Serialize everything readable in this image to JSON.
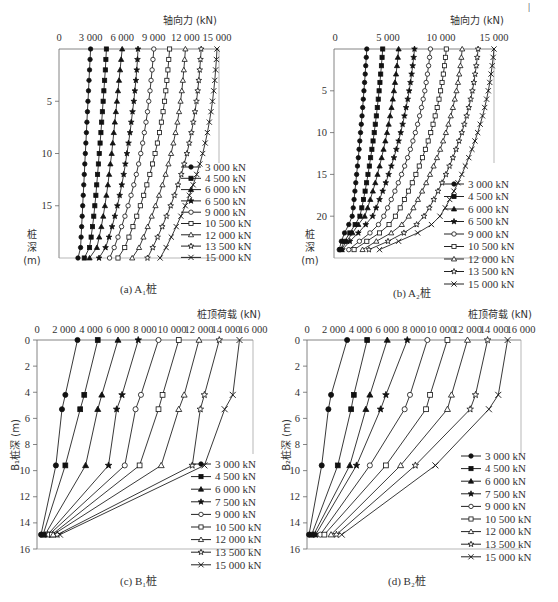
{
  "figure": {
    "corner_mark": "|"
  },
  "legend_marker_glyphs": {
    "filled-circle": "●",
    "filled-square": "■",
    "filled-triangle": "▲",
    "filled-star": "★",
    "open-circle": "○",
    "open-square": "□",
    "open-triangle": "△",
    "open-star": "☆",
    "cross": "×"
  },
  "chart_data": [
    {
      "id": "a",
      "type": "line",
      "title": "",
      "caption": "(a) A₁桩",
      "xlabel": "轴向力 (kN)",
      "ylabel": "桩\n深\n(m)",
      "ylabel_lines": [
        "桩",
        "深",
        "(m)"
      ],
      "x_ticks": [
        0,
        3000,
        6000,
        9000,
        12000,
        15000
      ],
      "x_tick_labels": [
        "0",
        "3 000",
        "6 000",
        "9 000",
        "12 000",
        "15 000"
      ],
      "y_ticks": [
        5,
        10,
        15
      ],
      "y_tick_labels": [
        "5",
        "10",
        "15"
      ],
      "xlim": [
        0,
        15000
      ],
      "ylim": [
        0,
        20
      ],
      "x_axis_position": "top",
      "y_inverted": true,
      "grid": false,
      "legend_position": "lower right (outside)",
      "box": {
        "x0": 59,
        "x1": 219,
        "y0": 49,
        "y1": 258,
        "xpx0": 59,
        "xpx1": 217
      },
      "depth": [
        0,
        1,
        2,
        3,
        4,
        5,
        6,
        7,
        8,
        9,
        10,
        11,
        12,
        13,
        14,
        15,
        16,
        17,
        18,
        19,
        20
      ],
      "series": [
        {
          "name": "3 000 kN",
          "marker": "filled-circle",
          "values": [
            3000,
            2950,
            2900,
            2850,
            2800,
            2750,
            2700,
            2650,
            2600,
            2550,
            2500,
            2450,
            2400,
            2350,
            2300,
            2250,
            2200,
            2150,
            2100,
            2050,
            1800
          ]
        },
        {
          "name": "4 500 kN",
          "marker": "filled-square",
          "values": [
            4500,
            4450,
            4400,
            4330,
            4260,
            4190,
            4120,
            4050,
            3980,
            3900,
            3820,
            3740,
            3660,
            3580,
            3500,
            3400,
            3300,
            3180,
            3050,
            2900,
            2400
          ]
        },
        {
          "name": "6 000 kN",
          "marker": "filled-triangle",
          "values": [
            6000,
            5900,
            5800,
            5700,
            5600,
            5500,
            5400,
            5300,
            5200,
            5100,
            5000,
            4880,
            4760,
            4640,
            4500,
            4360,
            4200,
            4020,
            3820,
            3600,
            2900
          ]
        },
        {
          "name": "6 500 kN",
          "marker": "filled-star",
          "values": [
            7500,
            7450,
            7380,
            7300,
            7200,
            7100,
            6980,
            6860,
            6740,
            6600,
            6450,
            6300,
            6140,
            5960,
            5760,
            5540,
            5300,
            5040,
            4750,
            4420,
            3800
          ]
        },
        {
          "name": "9 000 kN",
          "marker": "open-circle",
          "values": [
            9000,
            8920,
            8840,
            8740,
            8640,
            8520,
            8400,
            8260,
            8100,
            7940,
            7760,
            7560,
            7340,
            7100,
            6840,
            6560,
            6260,
            5940,
            5600,
            5240,
            4800
          ]
        },
        {
          "name": "10 500 kN",
          "marker": "open-square",
          "values": [
            10500,
            10420,
            10340,
            10240,
            10140,
            10020,
            9880,
            9720,
            9540,
            9340,
            9120,
            8880,
            8620,
            8340,
            8040,
            7720,
            7380,
            7020,
            6640,
            6240,
            5600
          ]
        },
        {
          "name": "12 000 kN",
          "marker": "open-triangle",
          "values": [
            12000,
            11930,
            11850,
            11760,
            11660,
            11540,
            11400,
            11240,
            11060,
            10860,
            10640,
            10390,
            10120,
            9820,
            9500,
            9160,
            8800,
            8420,
            8020,
            7600,
            6950
          ]
        },
        {
          "name": "13 500 kN",
          "marker": "open-star",
          "values": [
            13500,
            13430,
            13360,
            13270,
            13170,
            13050,
            12910,
            12750,
            12570,
            12370,
            12140,
            11890,
            11610,
            11300,
            10960,
            10600,
            10210,
            9800,
            9360,
            8900,
            8400
          ]
        },
        {
          "name": "15 000 kN",
          "marker": "cross",
          "values": [
            15000,
            14940,
            14870,
            14790,
            14690,
            14570,
            14430,
            14270,
            14090,
            13880,
            13640,
            13370,
            13070,
            12740,
            12380,
            11990,
            11570,
            11130,
            10660,
            10170,
            9600
          ]
        }
      ]
    },
    {
      "id": "b",
      "type": "line",
      "title": "",
      "caption": "(b) A₂桩",
      "xlabel": "轴向力 (kN)",
      "ylabel": "桩\n深\n(m)",
      "ylabel_lines": [
        "桩",
        "深",
        "(m)"
      ],
      "x_ticks": [
        0,
        5000,
        10000,
        15000
      ],
      "x_tick_labels": [
        "0",
        "5 000",
        "10 000",
        "15 000"
      ],
      "y_ticks": [
        5,
        10,
        15,
        20
      ],
      "y_tick_labels": [
        "5",
        "10",
        "15",
        "20"
      ],
      "xlim": [
        0,
        15000
      ],
      "ylim": [
        0,
        25
      ],
      "x_axis_position": "top",
      "y_inverted": true,
      "grid": false,
      "legend_position": "lower right (outside)",
      "box": {
        "x0": 334,
        "x1": 494,
        "y0": 49,
        "y1": 258,
        "xpx0": 335,
        "xpx1": 494
      },
      "depth": [
        0,
        1,
        2,
        3,
        4,
        5,
        6,
        7,
        8,
        9,
        10,
        11,
        12,
        13,
        14,
        15,
        16,
        17,
        18,
        19,
        20,
        21,
        22,
        23,
        24
      ],
      "series": [
        {
          "name": "3 000 kN",
          "marker": "filled-circle",
          "values": [
            3000,
            2950,
            2900,
            2850,
            2790,
            2730,
            2670,
            2610,
            2550,
            2480,
            2410,
            2340,
            2270,
            2200,
            2120,
            2040,
            1960,
            1880,
            1800,
            1720,
            1620,
            1300,
            900,
            600,
            400
          ]
        },
        {
          "name": "4 500 kN",
          "marker": "filled-square",
          "values": [
            4500,
            4440,
            4380,
            4310,
            4240,
            4160,
            4080,
            3990,
            3900,
            3800,
            3700,
            3590,
            3480,
            3360,
            3240,
            3110,
            2980,
            2840,
            2690,
            2530,
            2350,
            1900,
            1400,
            900,
            500
          ]
        },
        {
          "name": "6 000 kN",
          "marker": "filled-triangle",
          "values": [
            6000,
            5930,
            5850,
            5760,
            5660,
            5560,
            5450,
            5330,
            5200,
            5060,
            4910,
            4750,
            4580,
            4400,
            4210,
            4010,
            3800,
            3570,
            3330,
            3080,
            2800,
            2200,
            1650,
            1100,
            600
          ]
        },
        {
          "name": "6 500 kN",
          "marker": "filled-star",
          "values": [
            7500,
            7420,
            7330,
            7230,
            7120,
            7000,
            6860,
            6710,
            6550,
            6380,
            6200,
            6000,
            5790,
            5560,
            5320,
            5060,
            4790,
            4500,
            4200,
            3880,
            3550,
            2900,
            2200,
            1400,
            700
          ]
        },
        {
          "name": "9 000 kN",
          "marker": "open-circle",
          "values": [
            9000,
            8920,
            8830,
            8720,
            8600,
            8470,
            8320,
            8160,
            7980,
            7790,
            7580,
            7350,
            7110,
            6850,
            6570,
            6280,
            5970,
            5650,
            5310,
            4960,
            4600,
            4100,
            3300,
            2300,
            1300
          ]
        },
        {
          "name": "10 500 kN",
          "marker": "open-square",
          "values": [
            10500,
            10420,
            10330,
            10220,
            10100,
            9960,
            9810,
            9640,
            9450,
            9250,
            9030,
            8790,
            8530,
            8250,
            7950,
            7630,
            7290,
            6930,
            6550,
            6150,
            5700,
            5100,
            4200,
            3000,
            1800
          ]
        },
        {
          "name": "12 000 kN",
          "marker": "open-triangle",
          "values": [
            12000,
            11920,
            11830,
            11720,
            11600,
            11460,
            11300,
            11120,
            10920,
            10700,
            10460,
            10200,
            9920,
            9620,
            9300,
            8960,
            8600,
            8220,
            7820,
            7400,
            6950,
            6300,
            5300,
            3900,
            2600
          ]
        },
        {
          "name": "13 500 kN",
          "marker": "open-star",
          "values": [
            13500,
            13420,
            13330,
            13220,
            13100,
            12960,
            12800,
            12620,
            12420,
            12200,
            11960,
            11700,
            11420,
            11120,
            10800,
            10460,
            10100,
            9720,
            9320,
            8900,
            8400,
            7700,
            6500,
            5000,
            3200
          ]
        },
        {
          "name": "15 000 kN",
          "marker": "cross",
          "values": [
            15000,
            14920,
            14830,
            14720,
            14600,
            14460,
            14300,
            14120,
            13920,
            13700,
            13460,
            13200,
            12920,
            12620,
            12300,
            11960,
            11600,
            11220,
            10820,
            10400,
            9900,
            9100,
            7800,
            6000,
            4200
          ]
        }
      ]
    },
    {
      "id": "c",
      "type": "line",
      "title": "",
      "caption": "(c) B₁桩",
      "xlabel": "桩顶荷载 (kN)",
      "ylabel": "B₁桩深 (m)",
      "x_ticks": [
        0,
        2000,
        4000,
        6000,
        8000,
        10000,
        12000,
        14000,
        16000
      ],
      "x_tick_labels": [
        "0",
        "2 000",
        "4 000",
        "6 000",
        "8 000",
        "10 000",
        "12 000",
        "14 000",
        "16 000"
      ],
      "y_ticks": [
        0,
        2,
        4,
        6,
        8,
        10,
        12,
        14,
        16
      ],
      "y_tick_labels": [
        "0",
        "2",
        "4",
        "6",
        "8",
        "10",
        "12",
        "14",
        "16"
      ],
      "xlim": [
        0,
        16000
      ],
      "ylim": [
        0,
        16
      ],
      "x_axis_position": "top",
      "y_inverted": true,
      "grid": false,
      "legend_position": "lower right (outside)",
      "box": {
        "x0": 37,
        "x1": 253,
        "y0": 340,
        "y1": 549,
        "xpx0": 37,
        "xpx1": 253
      },
      "depth": [
        0,
        4.2,
        5.3,
        9.6,
        14.9
      ],
      "series": [
        {
          "name": "3 000 kN",
          "marker": "filled-circle",
          "values": [
            3000,
            2100,
            1850,
            1400,
            300
          ]
        },
        {
          "name": "4 500 kN",
          "marker": "filled-square",
          "values": [
            4500,
            3500,
            3200,
            2100,
            450
          ]
        },
        {
          "name": "6 000 kN",
          "marker": "filled-triangle",
          "values": [
            6000,
            4800,
            4500,
            3600,
            600
          ]
        },
        {
          "name": "7 500 kN",
          "marker": "filled-star",
          "values": [
            7500,
            6300,
            5900,
            5300,
            800
          ]
        },
        {
          "name": "9 000 kN",
          "marker": "open-circle",
          "values": [
            9000,
            7700,
            7300,
            6500,
            900
          ]
        },
        {
          "name": "10 500 kN",
          "marker": "open-square",
          "values": [
            10500,
            9300,
            9000,
            7600,
            1100
          ]
        },
        {
          "name": "12 000 kN",
          "marker": "open-triangle",
          "values": [
            12000,
            10900,
            10500,
            9200,
            1200
          ]
        },
        {
          "name": "13 500 kN",
          "marker": "open-star",
          "values": [
            13500,
            12400,
            12100,
            11500,
            1500
          ]
        },
        {
          "name": "15 000 kN",
          "marker": "cross",
          "values": [
            15000,
            14500,
            13900,
            12400,
            1700
          ]
        }
      ]
    },
    {
      "id": "d",
      "type": "line",
      "title": "",
      "caption": "(d) B₂桩",
      "xlabel": "桩顶荷载 (kN)",
      "ylabel": "B₂桩深 (m)",
      "x_ticks": [
        0,
        2000,
        4000,
        6000,
        8000,
        10000,
        12000,
        14000,
        16000
      ],
      "x_tick_labels": [
        "0",
        "2 000",
        "4 000",
        "6 000",
        "8 000",
        "10 000",
        "12 000",
        "14 000",
        "16 000"
      ],
      "y_ticks": [
        0,
        2,
        4,
        6,
        8,
        10,
        12,
        14,
        16
      ],
      "y_tick_labels": [
        "0",
        "2",
        "4",
        "6",
        "8",
        "10",
        "12",
        "14",
        "16"
      ],
      "xlim": [
        0,
        16000
      ],
      "ylim": [
        0,
        16
      ],
      "x_axis_position": "top",
      "y_inverted": true,
      "grid": false,
      "legend_position": "lower right (outside)",
      "box": {
        "x0": 307,
        "x1": 521,
        "y0": 340,
        "y1": 549,
        "xpx0": 307,
        "xpx1": 521
      },
      "depth": [
        0,
        4.2,
        5.3,
        9.6,
        14.9
      ],
      "series": [
        {
          "name": "3 000 kN",
          "marker": "filled-circle",
          "values": [
            3000,
            1800,
            1600,
            1100,
            150
          ]
        },
        {
          "name": "4 500 kN",
          "marker": "filled-square",
          "values": [
            4500,
            3500,
            3300,
            2300,
            350
          ]
        },
        {
          "name": "6 000 kN",
          "marker": "filled-triangle",
          "values": [
            6000,
            4700,
            4400,
            3200,
            500
          ]
        },
        {
          "name": "7 500 kN",
          "marker": "filled-star",
          "values": [
            7500,
            5900,
            5500,
            3700,
            650
          ]
        },
        {
          "name": "9 000 kN",
          "marker": "open-circle",
          "values": [
            9000,
            7700,
            7300,
            4700,
            1000
          ]
        },
        {
          "name": "10 500 kN",
          "marker": "open-square",
          "values": [
            10500,
            9200,
            8900,
            5900,
            1300
          ]
        },
        {
          "name": "12 000 kN",
          "marker": "open-triangle",
          "values": [
            12000,
            10800,
            10500,
            7000,
            1800
          ]
        },
        {
          "name": "13 500 kN",
          "marker": "open-star",
          "values": [
            13500,
            12600,
            12200,
            8100,
            2200
          ]
        },
        {
          "name": "15 000 kN",
          "marker": "cross",
          "values": [
            15000,
            14300,
            13600,
            9600,
            2600
          ]
        }
      ]
    }
  ]
}
